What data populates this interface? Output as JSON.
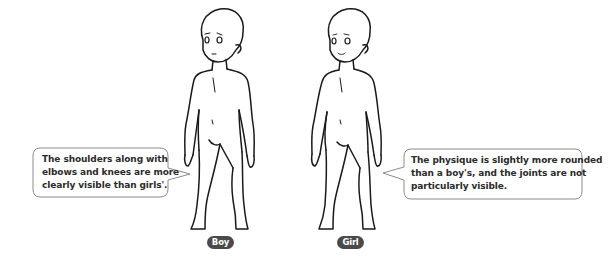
{
  "figures": [
    {
      "id": "boy",
      "label": "Boy",
      "description": "The shoulders along with elbows and knees are more clearly visible than girls'.",
      "description_lines": [
        "The shoulders along with",
        "elbows and knees are more",
        "clearly visible than girls'."
      ]
    },
    {
      "id": "girl",
      "label": "Girl",
      "description": "The physique is slightly more rounded than a boy's, and the joints are not particularly visible.",
      "description_lines": [
        "The physique is slightly more rounded",
        "than a boy's, and the joints are not",
        "particularly visible."
      ]
    }
  ],
  "colors": {
    "line": "#1a1a1a",
    "bubble_border": "#8c8c8c",
    "badge_bg": "#4a4a4a",
    "badge_text": "#ffffff",
    "text": "#2b2b2b"
  }
}
